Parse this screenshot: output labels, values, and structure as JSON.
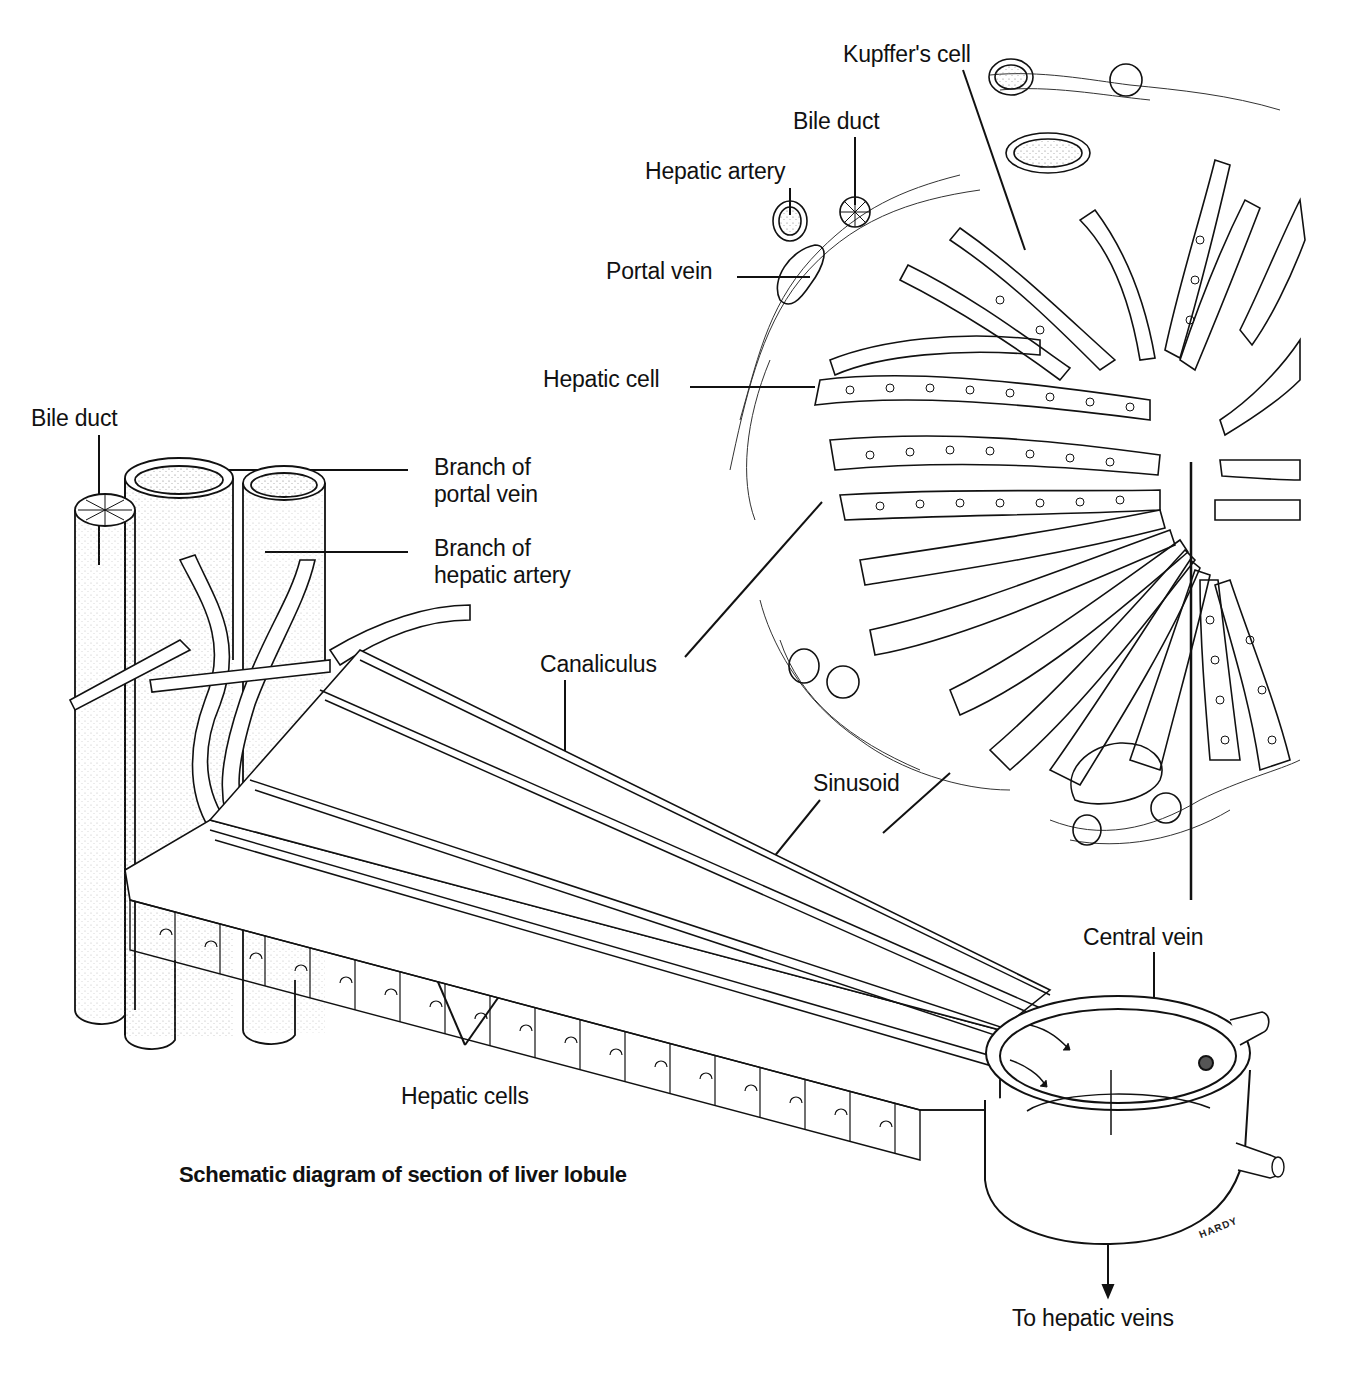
{
  "figure": {
    "title": "Schematic diagram of section of liver lobule",
    "artist_signature": "HARDY",
    "colors": {
      "ink": "#111111",
      "background": "#ffffff",
      "stipple": "#8a8a8a"
    }
  },
  "labels": {
    "lobule_cross_section": {
      "kupffers_cell": "Kupffer's cell",
      "bile_duct": "Bile duct",
      "hepatic_artery": "Hepatic artery",
      "portal_vein": "Portal vein",
      "hepatic_cell": "Hepatic cell",
      "canaliculus": "Canaliculus",
      "sinusoid": "Sinusoid"
    },
    "portal_triad_3d": {
      "bile_duct": "Bile duct",
      "branch_portal_vein_line1": "Branch of",
      "branch_portal_vein_line2": "portal vein",
      "branch_hepatic_artery_line1": "Branch of",
      "branch_hepatic_artery_line2": "hepatic artery"
    },
    "plate": {
      "hepatic_cells": "Hepatic cells"
    },
    "outflow": {
      "central_vein": "Central vein",
      "to_hepatic_veins": "To hepatic veins"
    }
  }
}
